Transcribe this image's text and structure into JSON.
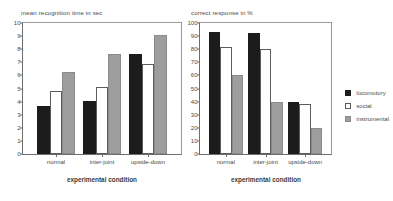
{
  "legend": {
    "position": "right",
    "entries": [
      {
        "label": "locomotory",
        "color": "#1c1c1c",
        "key": "locomotory"
      },
      {
        "label": "social",
        "color": "#ffffff",
        "key": "social"
      },
      {
        "label": "instrumental",
        "color": "#9e9e9e",
        "key": "instrumental"
      }
    ]
  },
  "chart_data": [
    {
      "type": "bar",
      "title": "mean recognition time in sec",
      "xlabel": "experimental condition",
      "ylabel": "",
      "ylim": [
        0,
        10
      ],
      "ytick_step": 1,
      "yticks": [
        "10",
        "9",
        "8",
        "7",
        "6",
        "5",
        "4",
        "3",
        "2",
        "1",
        "0"
      ],
      "grid": false,
      "categories": [
        "normal",
        "inter-joint",
        "upside-down"
      ],
      "series": [
        {
          "name": "locomotory",
          "color": "#1c1c1c",
          "values": [
            3.7,
            4.05,
            7.6
          ]
        },
        {
          "name": "social",
          "color": "#ffffff",
          "values": [
            4.8,
            5.1,
            6.9
          ]
        },
        {
          "name": "instrumental",
          "color": "#9e9e9e",
          "values": [
            6.25,
            7.6,
            9.1
          ]
        }
      ]
    },
    {
      "type": "bar",
      "title": "correct response in %",
      "xlabel": "experimental  condition",
      "ylabel": "",
      "ylim": [
        0,
        100
      ],
      "ytick_step": 10,
      "yticks": [
        "100",
        "90",
        "80",
        "70",
        "60",
        "50",
        "40",
        "30",
        "20",
        "10",
        "0"
      ],
      "grid": false,
      "categories": [
        "normal",
        "inter-joint",
        "upside-down"
      ],
      "series": [
        {
          "name": "locomotory",
          "color": "#1c1c1c",
          "values": [
            93,
            92,
            40
          ]
        },
        {
          "name": "social",
          "color": "#ffffff",
          "values": [
            82,
            80,
            38
          ]
        },
        {
          "name": "instrumental",
          "color": "#9e9e9e",
          "values": [
            60,
            40,
            20
          ]
        }
      ]
    }
  ]
}
